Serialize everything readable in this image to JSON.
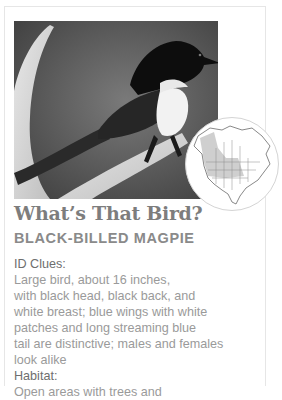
{
  "card": {
    "photo": {
      "subject": "black-billed magpie perched on antler",
      "alt": "Black-billed magpie photo"
    },
    "range_map": {
      "subject": "North America range map",
      "highlight_color": "#c9c9c9"
    },
    "title": "What’s That Bird?",
    "species": "BLACK-BILLED MAGPIE",
    "entries": [
      {
        "label": "ID Clues:",
        "lines": [
          "Large bird, about 16 inches,",
          "with black head, black back, and",
          "white breast; blue wings with white",
          "patches and long streaming blue",
          "tail are distinctive; males and females",
          "look alike"
        ]
      },
      {
        "label": "Habitat:",
        "lines": [
          "Open areas with trees and"
        ]
      }
    ]
  },
  "colors": {
    "title": "#7d7d7d",
    "species": "#8a8a8a",
    "label": "#6e6e6e",
    "body": "#9a9a9a",
    "border": "#e6e6e6"
  }
}
